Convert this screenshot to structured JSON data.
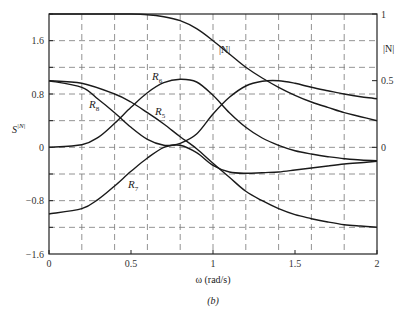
{
  "chart_data": {
    "type": "line",
    "title": "",
    "caption": "(b)",
    "xlabel": "ω (rad/s)",
    "ylabel": "S^|N|",
    "ylabel_right": "|N|",
    "xlim": [
      0,
      2
    ],
    "ylim": [
      -1.6,
      2.0
    ],
    "ylim_right": [
      0,
      1
    ],
    "grid": true,
    "grid_style": "dashed",
    "x_ticks": [
      "0",
      "0.5",
      "1",
      "1.5",
      "2"
    ],
    "y_ticks": [
      "1.6",
      "0.8",
      "0",
      "-0.8",
      "-1.6"
    ],
    "y_ticks_right": [
      "1",
      "0.5",
      "0"
    ],
    "series": [
      {
        "name": "|N|",
        "axis": "right",
        "x": [
          0,
          0.2,
          0.4,
          0.5,
          0.6,
          0.7,
          0.8,
          0.9,
          1.0,
          1.1,
          1.2,
          1.3,
          1.4,
          1.5,
          1.6,
          1.7,
          1.8,
          1.9,
          2.0
        ],
        "y": [
          1.0,
          1.0,
          1.0,
          1.0,
          0.995,
          0.98,
          0.95,
          0.89,
          0.8,
          0.7,
          0.6,
          0.52,
          0.45,
          0.39,
          0.34,
          0.3,
          0.26,
          0.23,
          0.2
        ]
      },
      {
        "name": "R5",
        "x": [
          0,
          0.2,
          0.4,
          0.5,
          0.6,
          0.7,
          0.8,
          0.9,
          1.0,
          1.1,
          1.2,
          1.3,
          1.4,
          1.5,
          1.6,
          1.7,
          1.8,
          1.9,
          2.0
        ],
        "y": [
          1.0,
          0.96,
          0.8,
          0.68,
          0.52,
          0.35,
          0.16,
          -0.02,
          -0.24,
          -0.45,
          -0.66,
          -0.8,
          -0.92,
          -1.01,
          -1.07,
          -1.12,
          -1.16,
          -1.18,
          -1.2
        ]
      },
      {
        "name": "R6",
        "x": [
          0,
          0.2,
          0.3,
          0.4,
          0.5,
          0.6,
          0.7,
          0.8,
          0.9,
          1.0,
          1.1,
          1.2,
          1.3,
          1.4,
          1.5,
          1.6,
          1.7,
          1.8,
          1.9,
          2.0
        ],
        "y": [
          0.0,
          0.04,
          0.15,
          0.36,
          0.6,
          0.82,
          0.97,
          1.02,
          0.98,
          0.78,
          0.52,
          0.3,
          0.14,
          0.03,
          -0.05,
          -0.1,
          -0.14,
          -0.17,
          -0.19,
          -0.2
        ]
      },
      {
        "name": "R7",
        "x": [
          0,
          0.2,
          0.3,
          0.4,
          0.5,
          0.6,
          0.7,
          0.8,
          0.9,
          1.0,
          1.1,
          1.2,
          1.3,
          1.4,
          1.5,
          1.6,
          1.7,
          1.8,
          1.9,
          2.0
        ],
        "y": [
          -1.0,
          -0.92,
          -0.78,
          -0.58,
          -0.36,
          -0.16,
          0.0,
          0.06,
          0.2,
          0.5,
          0.75,
          0.92,
          0.99,
          1.0,
          0.96,
          0.9,
          0.85,
          0.8,
          0.76,
          0.73
        ]
      },
      {
        "name": "R8",
        "x": [
          0,
          0.2,
          0.3,
          0.4,
          0.5,
          0.6,
          0.7,
          0.8,
          0.9,
          1.0,
          1.1,
          1.2,
          1.3,
          1.4,
          1.5,
          1.6,
          1.7,
          1.8,
          1.9,
          2.0
        ],
        "y": [
          1.0,
          0.9,
          0.72,
          0.52,
          0.3,
          0.12,
          0.03,
          0.03,
          -0.08,
          -0.27,
          -0.37,
          -0.39,
          -0.38,
          -0.37,
          -0.34,
          -0.31,
          -0.28,
          -0.25,
          -0.23,
          -0.21
        ]
      }
    ],
    "annotations": [
      {
        "text": "|N|",
        "x": 1.07,
        "y": 1.45
      },
      {
        "text": "R6",
        "x": 0.67,
        "y": 1.05
      },
      {
        "text": "R8",
        "x": 0.3,
        "y": 0.56
      },
      {
        "text": "R5",
        "x": 0.7,
        "y": 0.48
      },
      {
        "text": "R7",
        "x": 0.52,
        "y": -0.57
      }
    ]
  },
  "labels": {
    "xlabel": "ω (rad/s)",
    "ylabel_main": "S",
    "ylabel_sup": "|N|",
    "ylabel_right": "|N|",
    "caption": "(b)",
    "curve_N": "|N|",
    "curve_R": "R",
    "sub5": "5",
    "sub6": "6",
    "sub7": "7",
    "sub8": "8"
  }
}
